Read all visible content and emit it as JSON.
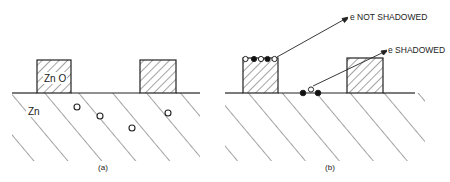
{
  "figure": {
    "panels": [
      {
        "id": "a",
        "caption": "(a)",
        "labels": {
          "oxide": "Zn O",
          "metal": "Zn"
        }
      },
      {
        "id": "b",
        "caption": "(b)",
        "annotations": {
          "not_shadowed": "e NOT SHADOWED",
          "shadowed": "e SHADOWED"
        }
      }
    ],
    "colors": {
      "ink": "#222222",
      "background": "#ffffff"
    }
  }
}
